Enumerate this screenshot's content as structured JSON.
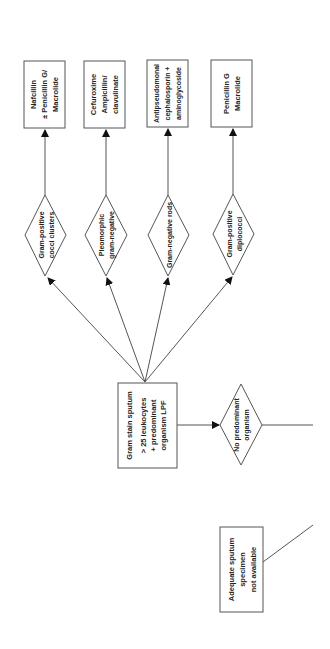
{
  "diagram": {
    "type": "flowchart",
    "orientation": "rotated-90-ccw",
    "colors": {
      "stroke": "#555555",
      "text": "#222222",
      "background": "#ffffff"
    },
    "nodes": {
      "start": {
        "shape": "box",
        "lines": [
          "Adequate sputum",
          "specimen",
          "not available"
        ]
      },
      "gram_stain": {
        "shape": "box",
        "lines": [
          "Gram stain sputum",
          "> 25 leukocytes",
          "+ predominant",
          "organism LPF"
        ]
      },
      "no_predominant": {
        "shape": "diamond",
        "lines": [
          "No predominant",
          "organism"
        ]
      },
      "gp_clusters": {
        "shape": "diamond",
        "lines": [
          "Gram-positive",
          "cocci clusters"
        ]
      },
      "pleomorphic": {
        "shape": "diamond",
        "lines": [
          "Pleomorphic",
          "gram-negative"
        ]
      },
      "gn_rods": {
        "shape": "diamond",
        "lines": [
          "Gram-negative rods"
        ]
      },
      "gp_diplococci": {
        "shape": "diamond",
        "lines": [
          "Gram-positive",
          "diplococci"
        ]
      },
      "tx_nafcillin": {
        "shape": "box",
        "lines": [
          "Nafcillin",
          "± Penicillin G/",
          "Macrolide"
        ]
      },
      "tx_cefuroxime": {
        "shape": "box",
        "lines": [
          "Cefuroxime",
          "Ampicillin/",
          "clavulinate"
        ]
      },
      "tx_antipseudomonal": {
        "shape": "box",
        "lines": [
          "Antipseudomonal",
          "cephalosporin +",
          "aminoglycoside"
        ]
      },
      "tx_penicillin": {
        "shape": "box",
        "lines": [
          "Penicillin G",
          "Macrolide"
        ]
      }
    },
    "edges": [
      {
        "from": "gram_stain",
        "to": "gp_clusters"
      },
      {
        "from": "gram_stain",
        "to": "pleomorphic"
      },
      {
        "from": "gram_stain",
        "to": "gn_rods"
      },
      {
        "from": "gram_stain",
        "to": "gp_diplococci"
      },
      {
        "from": "gram_stain",
        "to": "no_predominant"
      },
      {
        "from": "gp_clusters",
        "to": "tx_nafcillin"
      },
      {
        "from": "pleomorphic",
        "to": "tx_cefuroxime"
      },
      {
        "from": "gn_rods",
        "to": "tx_antipseudomonal"
      },
      {
        "from": "gp_diplococci",
        "to": "tx_penicillin"
      }
    ]
  }
}
